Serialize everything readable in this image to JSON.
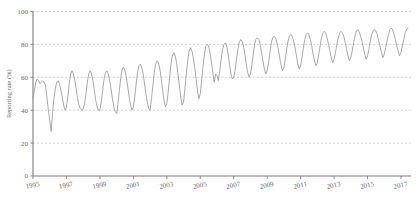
{
  "chart_data": {
    "type": "line",
    "title": "",
    "subtitle": "",
    "xlabel": "",
    "ylabel": "Reporting rate (%)",
    "xlim": [
      1995.0,
      2017.6
    ],
    "ylim": [
      0,
      100
    ],
    "grid": true,
    "grid_axis": "y",
    "legend": "none",
    "line_color": "#9a9a9a",
    "grid_color": "#b9b9b9",
    "axis_color": "#7d7d7d",
    "text_color": "#6a6a6a",
    "background": "#ffffff",
    "y_ticks": [
      0,
      20,
      40,
      60,
      80,
      100
    ],
    "y_tick_labels": [
      "0",
      "20",
      "40",
      "60",
      "80",
      "100"
    ],
    "x_ticks": [
      1995,
      1996,
      1997,
      1998,
      1999,
      2000,
      2001,
      2002,
      2003,
      2004,
      2005,
      2006,
      2007,
      2008,
      2009,
      2010,
      2011,
      2012,
      2013,
      2014,
      2015,
      2016,
      2017
    ],
    "x_tick_labels": [
      "1995",
      "",
      "1997",
      "",
      "1999",
      "",
      "2001",
      "",
      "2003",
      "",
      "2005",
      "",
      "2007",
      "",
      "2009",
      "",
      "2011",
      "",
      "2013",
      "",
      "2015",
      "",
      "2017"
    ],
    "x_visible_tick_labels": [
      "1995",
      "1997",
      "1999",
      "2001",
      "2003",
      "2005",
      "2007",
      "2009",
      "2011",
      "2013",
      "2015",
      "2017"
    ],
    "series": [
      {
        "name": "Reporting rate",
        "x": [
          1995.0,
          1995.083,
          1995.167,
          1995.25,
          1995.333,
          1995.417,
          1995.5,
          1995.583,
          1995.667,
          1995.75,
          1995.833,
          1995.917,
          1996.0,
          1996.083,
          1996.167,
          1996.25,
          1996.333,
          1996.417,
          1996.5,
          1996.583,
          1996.667,
          1996.75,
          1996.833,
          1996.917,
          1997.0,
          1997.083,
          1997.167,
          1997.25,
          1997.333,
          1997.417,
          1997.5,
          1997.583,
          1997.667,
          1997.75,
          1997.833,
          1997.917,
          1998.0,
          1998.083,
          1998.167,
          1998.25,
          1998.333,
          1998.417,
          1998.5,
          1998.583,
          1998.667,
          1998.75,
          1998.833,
          1998.917,
          1999.0,
          1999.083,
          1999.167,
          1999.25,
          1999.333,
          1999.417,
          1999.5,
          1999.583,
          1999.667,
          1999.75,
          1999.833,
          1999.917,
          2000.0,
          2000.083,
          2000.167,
          2000.25,
          2000.333,
          2000.417,
          2000.5,
          2000.583,
          2000.667,
          2000.75,
          2000.833,
          2000.917,
          2001.0,
          2001.083,
          2001.167,
          2001.25,
          2001.333,
          2001.417,
          2001.5,
          2001.583,
          2001.667,
          2001.75,
          2001.833,
          2001.917,
          2002.0,
          2002.083,
          2002.167,
          2002.25,
          2002.333,
          2002.417,
          2002.5,
          2002.583,
          2002.667,
          2002.75,
          2002.833,
          2002.917,
          2003.0,
          2003.083,
          2003.167,
          2003.25,
          2003.333,
          2003.417,
          2003.5,
          2003.583,
          2003.667,
          2003.75,
          2003.833,
          2003.917,
          2004.0,
          2004.083,
          2004.167,
          2004.25,
          2004.333,
          2004.417,
          2004.5,
          2004.583,
          2004.667,
          2004.75,
          2004.833,
          2004.917,
          2005.0,
          2005.083,
          2005.167,
          2005.25,
          2005.333,
          2005.417,
          2005.5,
          2005.583,
          2005.667,
          2005.75,
          2005.833,
          2005.917,
          2006.0,
          2006.083,
          2006.167,
          2006.25,
          2006.333,
          2006.417,
          2006.5,
          2006.583,
          2006.667,
          2006.75,
          2006.833,
          2006.917,
          2007.0,
          2007.083,
          2007.167,
          2007.25,
          2007.333,
          2007.417,
          2007.5,
          2007.583,
          2007.667,
          2007.75,
          2007.833,
          2007.917,
          2008.0,
          2008.083,
          2008.167,
          2008.25,
          2008.333,
          2008.417,
          2008.5,
          2008.583,
          2008.667,
          2008.75,
          2008.833,
          2008.917,
          2009.0,
          2009.083,
          2009.167,
          2009.25,
          2009.333,
          2009.417,
          2009.5,
          2009.583,
          2009.667,
          2009.75,
          2009.833,
          2009.917,
          2010.0,
          2010.083,
          2010.167,
          2010.25,
          2010.333,
          2010.417,
          2010.5,
          2010.583,
          2010.667,
          2010.75,
          2010.833,
          2010.917,
          2011.0,
          2011.083,
          2011.167,
          2011.25,
          2011.333,
          2011.417,
          2011.5,
          2011.583,
          2011.667,
          2011.75,
          2011.833,
          2011.917,
          2012.0,
          2012.083,
          2012.167,
          2012.25,
          2012.333,
          2012.417,
          2012.5,
          2012.583,
          2012.667,
          2012.75,
          2012.833,
          2012.917,
          2013.0,
          2013.083,
          2013.167,
          2013.25,
          2013.333,
          2013.417,
          2013.5,
          2013.583,
          2013.667,
          2013.75,
          2013.833,
          2013.917,
          2014.0,
          2014.083,
          2014.167,
          2014.25,
          2014.333,
          2014.417,
          2014.5,
          2014.583,
          2014.667,
          2014.75,
          2014.833,
          2014.917,
          2015.0,
          2015.083,
          2015.167,
          2015.25,
          2015.333,
          2015.417,
          2015.5,
          2015.583,
          2015.667,
          2015.75,
          2015.833,
          2015.917,
          2016.0,
          2016.083,
          2016.167,
          2016.25,
          2016.333,
          2016.417,
          2016.5,
          2016.583,
          2016.667,
          2016.75,
          2016.833,
          2016.917,
          2017.0,
          2017.083,
          2017.167,
          2017.25,
          2017.333,
          2017.417
        ],
        "values": [
          47,
          52,
          57,
          59,
          58,
          56,
          57,
          58,
          57,
          55,
          48,
          40,
          34,
          27,
          38,
          47,
          53,
          57,
          58,
          56,
          52,
          48,
          43,
          40,
          42,
          48,
          56,
          62,
          64,
          62,
          58,
          53,
          47,
          43,
          41,
          40,
          41,
          44,
          50,
          57,
          62,
          64,
          62,
          58,
          52,
          46,
          42,
          40,
          40,
          45,
          52,
          59,
          63,
          64,
          62,
          58,
          53,
          47,
          42,
          39,
          38,
          44,
          52,
          60,
          65,
          66,
          64,
          60,
          54,
          48,
          43,
          40,
          42,
          48,
          56,
          63,
          67,
          68,
          66,
          62,
          56,
          50,
          45,
          41,
          40,
          47,
          55,
          63,
          68,
          70,
          69,
          65,
          59,
          52,
          46,
          42,
          44,
          51,
          60,
          68,
          73,
          75,
          73,
          69,
          62,
          55,
          48,
          43,
          45,
          53,
          62,
          70,
          76,
          78,
          76,
          72,
          66,
          59,
          52,
          47,
          50,
          58,
          67,
          74,
          79,
          80,
          79,
          75,
          69,
          63,
          57,
          62,
          61,
          58,
          64,
          71,
          77,
          80,
          81,
          79,
          74,
          68,
          62,
          59,
          60,
          64,
          71,
          77,
          81,
          83,
          82,
          79,
          74,
          68,
          63,
          60,
          62,
          67,
          74,
          80,
          83,
          84,
          83,
          80,
          75,
          70,
          65,
          62,
          64,
          69,
          75,
          81,
          84,
          85,
          84,
          81,
          77,
          72,
          67,
          64,
          66,
          71,
          77,
          82,
          85,
          86,
          85,
          82,
          78,
          73,
          68,
          65,
          67,
          72,
          78,
          83,
          86,
          87,
          86,
          83,
          79,
          74,
          70,
          67,
          69,
          74,
          79,
          84,
          87,
          88,
          87,
          84,
          80,
          76,
          72,
          69,
          71,
          75,
          80,
          84,
          87,
          88,
          87,
          85,
          81,
          77,
          73,
          70,
          72,
          76,
          81,
          85,
          88,
          89,
          88,
          85,
          82,
          78,
          74,
          71,
          73,
          77,
          82,
          86,
          88,
          89,
          88,
          86,
          82,
          79,
          75,
          72,
          74,
          78,
          82,
          86,
          89,
          90,
          89,
          86,
          83,
          79,
          76,
          73,
          75,
          79,
          83,
          87,
          89,
          90
        ]
      }
    ],
    "notes": {
      "pattern": "Strong annual seasonality with mid-year peaks and year-end troughs; overall rising trend from ~50% in 1995 to ~90% by 2017",
      "min_value": 27,
      "min_year": 1996,
      "max_value": 90,
      "max_year": 2017
    }
  }
}
